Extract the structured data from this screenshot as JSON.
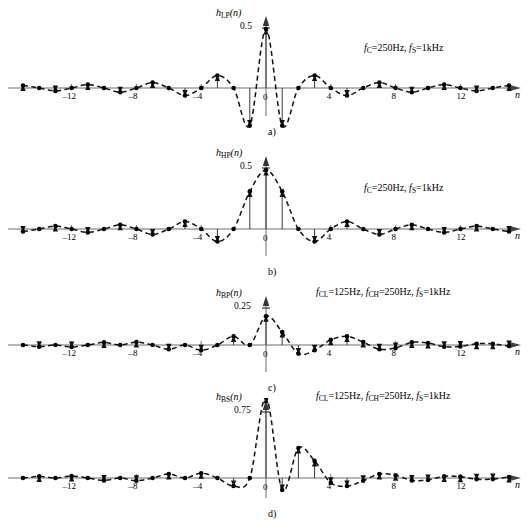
{
  "figure": {
    "axis_name": "n",
    "x_ticks": [
      "–12",
      "–8",
      "–4",
      "0",
      "4",
      "8",
      "12"
    ],
    "x_tick_values": [
      -12,
      -8,
      -4,
      0,
      4,
      8,
      12
    ],
    "x_range": [
      -15.5,
      15.5
    ]
  },
  "panels": [
    {
      "id": "a",
      "caption": "a)",
      "ylabel_main": "h",
      "ylabel_sub": "LP",
      "ylabel_arg": "(n)",
      "peak_label": "0.5",
      "peak_value": 0.5,
      "annotation": {
        "text": "f_C=250Hz, f_S=1kHz",
        "parts": [
          {
            "italic": "f",
            "sub": "C",
            "plain": "=250Hz,"
          },
          {
            "italic": "f",
            "sub": "S",
            "plain": "=1kHz"
          }
        ]
      }
    },
    {
      "id": "b",
      "caption": "b)",
      "ylabel_main": "h",
      "ylabel_sub": "HP",
      "ylabel_arg": "(n)",
      "peak_label": "0.5",
      "peak_value": 0.5,
      "annotation": {
        "text": "f_C=250Hz, f_S=1kHz",
        "parts": [
          {
            "italic": "f",
            "sub": "C",
            "plain": "=250Hz,"
          },
          {
            "italic": "f",
            "sub": "S",
            "plain": "=1kHz"
          }
        ]
      }
    },
    {
      "id": "c",
      "caption": "c)",
      "ylabel_main": "h",
      "ylabel_sub": "BP",
      "ylabel_arg": "(n)",
      "peak_label": "0.25",
      "peak_value": 0.25,
      "annotation": {
        "text": "f_CL=125Hz, f_CH=250Hz, f_S=1kHz",
        "parts": [
          {
            "italic": "f",
            "sub": "CL",
            "plain": "=125Hz,"
          },
          {
            "italic": "f",
            "sub": "CH",
            "plain": "=250Hz,"
          },
          {
            "italic": "f",
            "sub": "S",
            "plain": "=1kHz"
          }
        ]
      }
    },
    {
      "id": "d",
      "caption": "d)",
      "ylabel_main": "h",
      "ylabel_sub": "BS",
      "ylabel_arg": "(n)",
      "peak_label": "0.75",
      "peak_value": 0.75,
      "annotation": {
        "text": "f_CL=125Hz, f_CH=250Hz, f_S=1kHz",
        "parts": [
          {
            "italic": "f",
            "sub": "CL",
            "plain": "=125Hz,"
          },
          {
            "italic": "f",
            "sub": "CH",
            "plain": "=250Hz,"
          },
          {
            "italic": "f",
            "sub": "S",
            "plain": "=1kHz"
          }
        ]
      }
    }
  ],
  "chart_data": [
    {
      "type": "line",
      "title": "h_LP(n) — lowpass impulse response",
      "xlabel": "n",
      "ylabel": "h_LP(n)",
      "xlim": [
        -15.5,
        15.5
      ],
      "ylim": [
        -0.12,
        0.55
      ],
      "grid": false,
      "legend": "none",
      "annotation": "f_C=250Hz, f_S=1kHz",
      "x": [
        -15,
        -14,
        -13,
        -12,
        -11,
        -10,
        -9,
        -8,
        -7,
        -6,
        -5,
        -4,
        -3,
        -2,
        -1,
        0,
        1,
        2,
        3,
        4,
        5,
        6,
        7,
        8,
        9,
        10,
        11,
        12,
        13,
        14,
        15
      ],
      "values": [
        0.0212,
        0.0,
        -0.0245,
        0.0,
        0.0289,
        0.0,
        -0.0354,
        0.0,
        0.0455,
        0.0,
        -0.0637,
        0.0,
        0.1061,
        0.0,
        -0.3183,
        0.5,
        -0.3183,
        0.0,
        0.1061,
        0.0,
        -0.0637,
        0.0,
        0.0455,
        0.0,
        -0.0354,
        0.0,
        0.0289,
        0.0,
        -0.0245,
        0.0,
        0.0212
      ]
    },
    {
      "type": "line",
      "title": "h_HP(n) — highpass impulse response",
      "xlabel": "n",
      "ylabel": "h_HP(n)",
      "xlim": [
        -15.5,
        15.5
      ],
      "ylim": [
        -0.38,
        0.55
      ],
      "grid": false,
      "legend": "none",
      "annotation": "f_C=250Hz, f_S=1kHz",
      "x": [
        -15,
        -14,
        -13,
        -12,
        -11,
        -10,
        -9,
        -8,
        -7,
        -6,
        -5,
        -4,
        -3,
        -2,
        -1,
        0,
        1,
        2,
        3,
        4,
        5,
        6,
        7,
        8,
        9,
        10,
        11,
        12,
        13,
        14,
        15
      ],
      "values": [
        -0.0212,
        0.0,
        0.0245,
        0.0,
        -0.0289,
        0.0,
        0.0354,
        0.0,
        -0.0455,
        0.0,
        0.0637,
        0.0,
        -0.1061,
        0.0,
        0.3183,
        0.5,
        0.3183,
        0.0,
        -0.1061,
        0.0,
        0.0637,
        0.0,
        -0.0455,
        0.0,
        0.0354,
        0.0,
        -0.0289,
        0.0,
        0.0245,
        0.0,
        -0.0212
      ]
    },
    {
      "type": "line",
      "title": "h_BP(n) — bandpass impulse response",
      "xlabel": "n",
      "ylabel": "h_BP(n)",
      "xlim": [
        -15.5,
        15.5
      ],
      "ylim": [
        -0.12,
        0.3
      ],
      "grid": false,
      "legend": "none",
      "annotation": "f_CL=125Hz, f_CH=250Hz, f_S=1kHz",
      "x": [
        -15,
        -14,
        -13,
        -12,
        -11,
        -10,
        -9,
        -8,
        -7,
        -6,
        -5,
        -4,
        -3,
        -2,
        -1,
        0,
        1,
        2,
        3,
        4,
        5,
        6,
        7,
        8,
        9,
        10,
        11,
        12,
        13,
        14,
        15
      ],
      "values": [
        0.0,
        -0.0152,
        0.0,
        -0.0177,
        0.0,
        0.0225,
        0.0,
        0.025,
        0.0,
        -0.0375,
        0.0,
        -0.045,
        0.0,
        0.075,
        0.0,
        0.25,
        0.1125,
        -0.075,
        -0.045,
        0.045,
        0.075,
        0.025,
        -0.0375,
        -0.025,
        0.0225,
        0.0177,
        -0.0152,
        -0.0125,
        0.0112,
        0.01,
        -0.009
      ]
    },
    {
      "type": "line",
      "title": "h_BS(n) — bandstop impulse response",
      "xlabel": "n",
      "ylabel": "h_BS(n)",
      "xlim": [
        -15.5,
        15.5
      ],
      "ylim": [
        -0.16,
        0.8
      ],
      "grid": false,
      "legend": "none",
      "annotation": "f_CL=125Hz, f_CH=250Hz, f_S=1kHz",
      "x": [
        -15,
        -14,
        -13,
        -12,
        -11,
        -10,
        -9,
        -8,
        -7,
        -6,
        -5,
        -4,
        -3,
        -2,
        -1,
        0,
        1,
        2,
        3,
        4,
        5,
        6,
        7,
        8,
        9,
        10,
        11,
        12,
        13,
        14,
        15
      ],
      "values": [
        0.0,
        0.0152,
        0.0,
        0.0177,
        0.0,
        -0.0225,
        0.0,
        -0.025,
        0.0,
        0.0375,
        0.0,
        0.045,
        0.0,
        -0.075,
        0.0,
        0.75,
        -0.1125,
        0.28,
        0.16,
        -0.045,
        -0.075,
        -0.025,
        0.0375,
        0.025,
        -0.0225,
        -0.0177,
        0.0152,
        0.0125,
        -0.0112,
        -0.01,
        0.009
      ]
    }
  ]
}
